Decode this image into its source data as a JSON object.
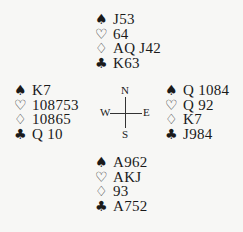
{
  "diagram": {
    "type": "bridge-deal",
    "suit_symbols": {
      "spades": "♠",
      "hearts": "♡",
      "diamonds": "♢",
      "clubs": "♣"
    },
    "hands": {
      "north": {
        "spades": "J53",
        "hearts": "64",
        "diamonds": "AQ J42",
        "clubs": "K63"
      },
      "west": {
        "spades": "K7",
        "hearts": "108753",
        "diamonds": "10865",
        "clubs": "Q 10"
      },
      "east": {
        "spades": "Q 1084",
        "hearts": "Q 92",
        "diamonds": "K7",
        "clubs": "J984"
      },
      "south": {
        "spades": "A962",
        "hearts": "AKJ",
        "diamonds": "93",
        "clubs": "A752"
      }
    },
    "compass": {
      "north": "N",
      "south": "S",
      "west": "W",
      "east": "E"
    }
  }
}
